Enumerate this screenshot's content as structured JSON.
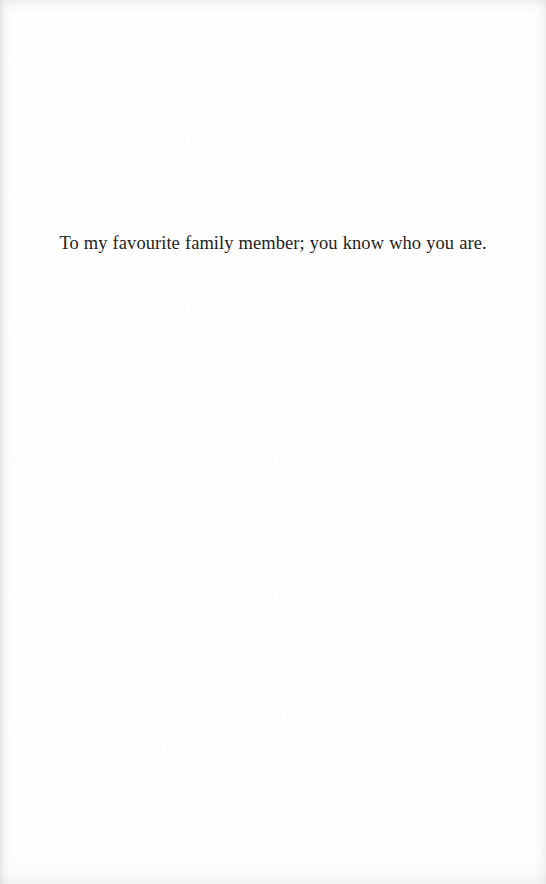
{
  "page": {
    "type": "book-dedication-page",
    "width": 546,
    "height": 884,
    "background_color": "#fefefe",
    "ink_color": "#1f1f1f"
  },
  "dedication": {
    "text": "To my favourite family member; you know who you are."
  }
}
